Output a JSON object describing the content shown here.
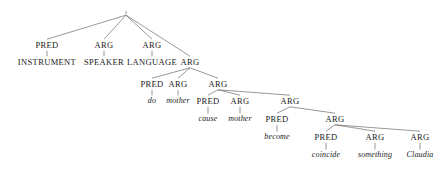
{
  "figure": {
    "name": "dependency-parse-tree",
    "width": 448,
    "height": 178,
    "background_color": "#ffffff",
    "edge_color": "#6b6b6b",
    "text_color": "#1a1a1a"
  },
  "nodes": [
    {
      "id": "root",
      "label": "",
      "style": "none",
      "x": 126,
      "y": 13
    },
    {
      "id": "n_pred1",
      "label": "PRED",
      "style": "caps",
      "x": 47,
      "y": 45
    },
    {
      "id": "n_arg1",
      "label": "ARG",
      "style": "caps",
      "x": 104,
      "y": 45
    },
    {
      "id": "n_arg2",
      "label": "ARG",
      "style": "caps",
      "x": 152,
      "y": 45
    },
    {
      "id": "n_instrument",
      "label": "INSTRUMENT",
      "style": "caps",
      "x": 47,
      "y": 62
    },
    {
      "id": "n_speaker",
      "label": "SPEAKER",
      "style": "caps",
      "x": 104,
      "y": 62
    },
    {
      "id": "n_language",
      "label": "LANGUAGE",
      "style": "caps",
      "x": 152,
      "y": 62
    },
    {
      "id": "n_arg3",
      "label": "ARG",
      "style": "caps",
      "x": 190,
      "y": 62
    },
    {
      "id": "n_pred2",
      "label": "PRED",
      "style": "caps",
      "x": 152,
      "y": 84
    },
    {
      "id": "n_arg4",
      "label": "ARG",
      "style": "caps",
      "x": 178,
      "y": 84
    },
    {
      "id": "n_arg5",
      "label": "ARG",
      "style": "caps",
      "x": 218,
      "y": 84
    },
    {
      "id": "l_do",
      "label": "do",
      "style": "leaf",
      "x": 152,
      "y": 101
    },
    {
      "id": "l_mother1",
      "label": "mother",
      "style": "leaf",
      "x": 178,
      "y": 101
    },
    {
      "id": "n_pred3",
      "label": "PRED",
      "style": "caps",
      "x": 208,
      "y": 101
    },
    {
      "id": "n_arg6",
      "label": "ARG",
      "style": "caps",
      "x": 240,
      "y": 101
    },
    {
      "id": "n_arg7",
      "label": "ARG",
      "style": "caps",
      "x": 290,
      "y": 101
    },
    {
      "id": "l_cause",
      "label": "cause",
      "style": "leaf",
      "x": 208,
      "y": 119
    },
    {
      "id": "l_mother2",
      "label": "mother",
      "style": "leaf",
      "x": 240,
      "y": 119
    },
    {
      "id": "n_pred4",
      "label": "PRED",
      "style": "caps",
      "x": 277,
      "y": 119
    },
    {
      "id": "n_arg8",
      "label": "ARG",
      "style": "caps",
      "x": 335,
      "y": 119
    },
    {
      "id": "l_become",
      "label": "become",
      "style": "leaf",
      "x": 277,
      "y": 137
    },
    {
      "id": "n_pred5",
      "label": "PRED",
      "style": "caps",
      "x": 326,
      "y": 137
    },
    {
      "id": "n_arg9",
      "label": "ARG",
      "style": "caps",
      "x": 375,
      "y": 137
    },
    {
      "id": "n_arg10",
      "label": "ARG",
      "style": "caps",
      "x": 420,
      "y": 137
    },
    {
      "id": "l_coincide",
      "label": "coincide",
      "style": "leaf",
      "x": 326,
      "y": 155
    },
    {
      "id": "l_something",
      "label": "something",
      "style": "leaf",
      "x": 375,
      "y": 155
    },
    {
      "id": "l_claudia",
      "label": "Claudia",
      "style": "leaf",
      "x": 420,
      "y": 155
    }
  ],
  "edges": [
    {
      "from": "root",
      "to": "n_pred1"
    },
    {
      "from": "root",
      "to": "n_arg1"
    },
    {
      "from": "root",
      "to": "n_arg2"
    },
    {
      "from": "root",
      "to": "n_arg3"
    },
    {
      "from": "n_pred1",
      "to": "n_instrument"
    },
    {
      "from": "n_arg1",
      "to": "n_speaker"
    },
    {
      "from": "n_arg2",
      "to": "n_language"
    },
    {
      "from": "n_arg3",
      "to": "n_pred2"
    },
    {
      "from": "n_arg3",
      "to": "n_arg4"
    },
    {
      "from": "n_arg3",
      "to": "n_arg5"
    },
    {
      "from": "n_pred2",
      "to": "l_do"
    },
    {
      "from": "n_arg4",
      "to": "l_mother1"
    },
    {
      "from": "n_arg5",
      "to": "n_pred3"
    },
    {
      "from": "n_arg5",
      "to": "n_arg6"
    },
    {
      "from": "n_arg5",
      "to": "n_arg7"
    },
    {
      "from": "n_pred3",
      "to": "l_cause"
    },
    {
      "from": "n_arg6",
      "to": "l_mother2"
    },
    {
      "from": "n_arg7",
      "to": "n_pred4"
    },
    {
      "from": "n_arg7",
      "to": "n_arg8"
    },
    {
      "from": "n_pred4",
      "to": "l_become"
    },
    {
      "from": "n_arg8",
      "to": "n_pred5"
    },
    {
      "from": "n_arg8",
      "to": "n_arg9"
    },
    {
      "from": "n_arg8",
      "to": "n_arg10"
    },
    {
      "from": "n_pred5",
      "to": "l_coincide"
    },
    {
      "from": "n_arg9",
      "to": "l_something"
    },
    {
      "from": "n_arg10",
      "to": "l_claudia"
    }
  ]
}
